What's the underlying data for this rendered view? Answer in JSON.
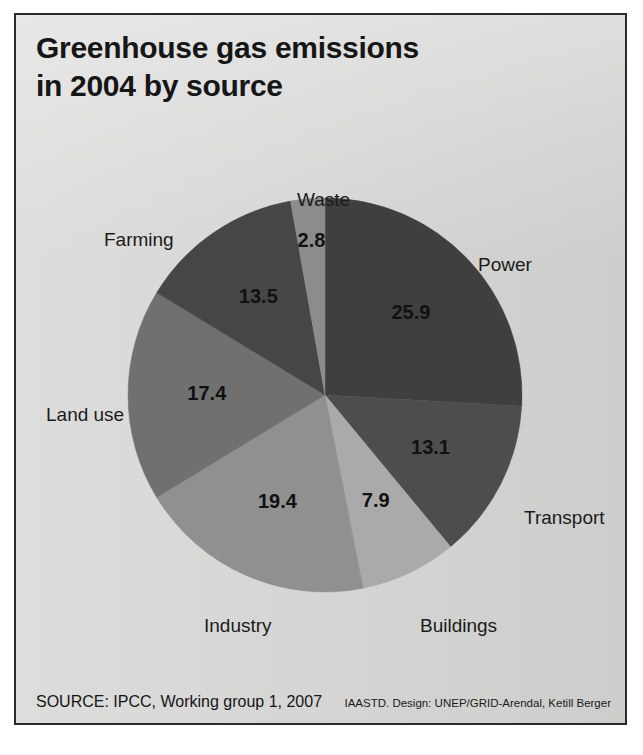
{
  "title": "Greenhouse gas emissions\nin 2004 by source",
  "footer": {
    "source": "SOURCE: IPCC, Working group 1, 2007",
    "credit": "IAASTD. Design: UNEP/GRID-Arendal, Ketill Berger"
  },
  "colors": {
    "background": "#d6d7d5",
    "frame": "#2b2b2b",
    "text": "#161616"
  },
  "chart_data": {
    "type": "pie",
    "title": "Greenhouse gas emissions in 2004 by source",
    "unit": "percent",
    "total": 100.0,
    "start_angle_deg": 0,
    "direction": "clockwise",
    "labels": [
      "Power",
      "Transport",
      "Buildings",
      "Industry",
      "Land use",
      "Farming",
      "Waste"
    ],
    "values": [
      25.9,
      13.1,
      7.9,
      19.4,
      17.4,
      13.5,
      2.8
    ],
    "value_labels": [
      "25.9",
      "13.1",
      "7.9",
      "19.4",
      "17.4",
      "13.5",
      "2.8"
    ],
    "colors": [
      "#3f3f3f",
      "#4d4d4d",
      "#aaaaaa",
      "#909090",
      "#707070",
      "#464646",
      "#8c8c8c"
    ],
    "legend": "none",
    "slices": [
      {
        "label": "Power",
        "value": 25.9,
        "value_label": "25.9",
        "color": "#3f3f3f",
        "label_x": 462,
        "label_y": 239
      },
      {
        "label": "Transport",
        "value": 13.1,
        "value_label": "13.1",
        "color": "#4d4d4d",
        "label_x": 508,
        "label_y": 492
      },
      {
        "label": "Buildings",
        "value": 7.9,
        "value_label": "7.9",
        "color": "#aaaaaa",
        "label_x": 404,
        "label_y": 600
      },
      {
        "label": "Industry",
        "value": 19.4,
        "value_label": "19.4",
        "color": "#909090",
        "label_x": 188,
        "label_y": 600
      },
      {
        "label": "Land use",
        "value": 17.4,
        "value_label": "17.4",
        "color": "#707070",
        "label_x": 30,
        "label_y": 389
      },
      {
        "label": "Farming",
        "value": 13.5,
        "value_label": "13.5",
        "color": "#464646",
        "label_x": 88,
        "label_y": 214
      },
      {
        "label": "Waste",
        "value": 2.8,
        "value_label": "2.8",
        "color": "#8c8c8c",
        "label_x": 281,
        "label_y": 174
      }
    ]
  }
}
